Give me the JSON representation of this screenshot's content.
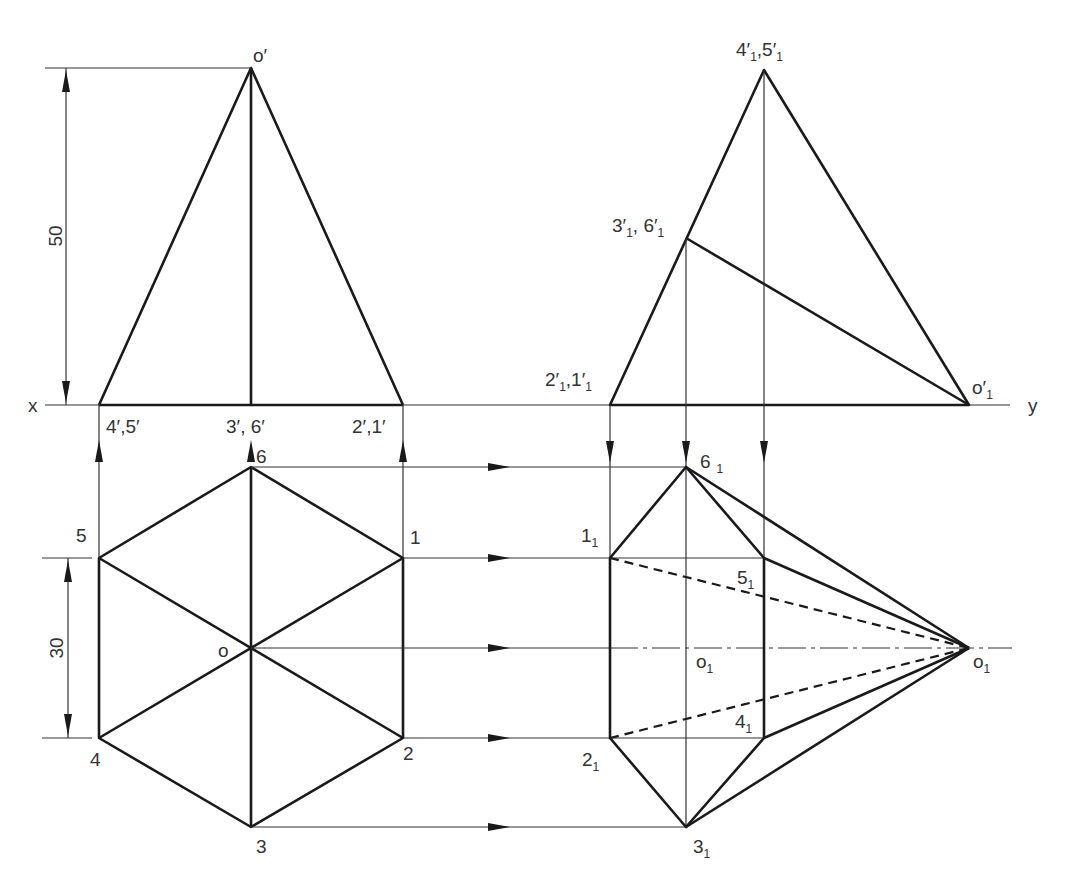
{
  "figure": {
    "reference_line": {
      "left_label": "x",
      "right_label": "y"
    },
    "dimensions": {
      "height": "50",
      "across_flats": "30"
    },
    "front_view": {
      "apex": "o′",
      "base_labels": [
        "4′,5′",
        "3′, 6′",
        "2′,1′"
      ]
    },
    "top_view": {
      "center": "o",
      "vertices": [
        "1",
        "2",
        "3",
        "4",
        "5",
        "6"
      ]
    },
    "auxiliary_elevation": {
      "apex": {
        "main": "o′",
        "sub": "1"
      },
      "labels": [
        {
          "id": "4p5p",
          "parts": [
            "4′",
            "1",
            ",5′",
            "1"
          ]
        },
        {
          "id": "3p6p",
          "parts": [
            "3′",
            "1",
            ", 6′",
            "1"
          ]
        },
        {
          "id": "2p1p",
          "parts": [
            "2′",
            "1",
            ",1′",
            "1"
          ]
        }
      ]
    },
    "auxiliary_plan": {
      "labels": [
        {
          "id": "6",
          "main": "6",
          "sub": "1"
        },
        {
          "id": "1",
          "main": "1",
          "sub": "1"
        },
        {
          "id": "5",
          "main": "5",
          "sub": "1"
        },
        {
          "id": "o",
          "main": "o",
          "sub": "1"
        },
        {
          "id": "4",
          "main": "4",
          "sub": "1"
        },
        {
          "id": "2",
          "main": "2",
          "sub": "1"
        },
        {
          "id": "3",
          "main": "3",
          "sub": "1"
        },
        {
          "id": "apex",
          "main": "o",
          "sub": "1"
        }
      ]
    },
    "colors": {
      "line": "#1a1a1a",
      "text": "#333333",
      "background": "#ffffff"
    }
  }
}
